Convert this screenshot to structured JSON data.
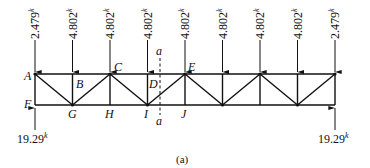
{
  "figure": {
    "caption": "(a)",
    "section_cut_label": "a",
    "units_superscript": "k"
  },
  "truss": {
    "panels": 8,
    "top_nodes": [
      "A",
      "B",
      "C",
      "D",
      "E",
      "",
      "",
      "",
      ""
    ],
    "bottom_nodes": [
      "F",
      "G",
      "H",
      "I",
      "J",
      "",
      "",
      "",
      ""
    ],
    "loads": [
      {
        "node": 0,
        "value": "2.479"
      },
      {
        "node": 1,
        "value": "4.802"
      },
      {
        "node": 2,
        "value": "4.802"
      },
      {
        "node": 3,
        "value": "4.802"
      },
      {
        "node": 4,
        "value": "4.802"
      },
      {
        "node": 5,
        "value": "4.802"
      },
      {
        "node": 6,
        "value": "4.802"
      },
      {
        "node": 7,
        "value": "4.802"
      },
      {
        "node": 8,
        "value": "2.479"
      }
    ],
    "reactions": {
      "left": "19.29",
      "right": "19.29"
    }
  },
  "labels": {
    "A": "A",
    "B": "B",
    "C": "C",
    "D": "D",
    "E": "E",
    "F": "F",
    "G": "G",
    "H": "H",
    "I": "I",
    "J": "J"
  }
}
